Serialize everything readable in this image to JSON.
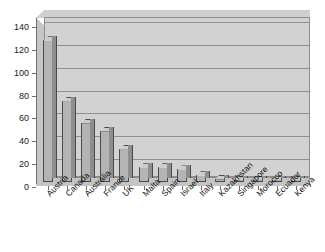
{
  "chart_data": {
    "type": "bar",
    "title": "",
    "subtitle": "",
    "xlabel": "",
    "ylabel": "",
    "ylim": [
      0,
      140
    ],
    "ytick_step": 20,
    "yticks": [
      0,
      20,
      40,
      60,
      80,
      100,
      120,
      140
    ],
    "grid": true,
    "legend": "none",
    "style": "3d-column",
    "bar_color": "#b4b4b4",
    "bar_edge_color": "#4a4a4a",
    "plot_background": "#d2d2d2",
    "categories": [
      "Austria",
      "Canada",
      "Australia",
      "France",
      "UK",
      "Malta",
      "Spain",
      "Israel",
      "Italy",
      "Kazakhstan",
      "Singapore",
      "Morocco",
      "Ecuador",
      "Kenya"
    ],
    "values": [
      124,
      71,
      52,
      45,
      29,
      13,
      13,
      11,
      6,
      3,
      2,
      2,
      2,
      2
    ]
  }
}
